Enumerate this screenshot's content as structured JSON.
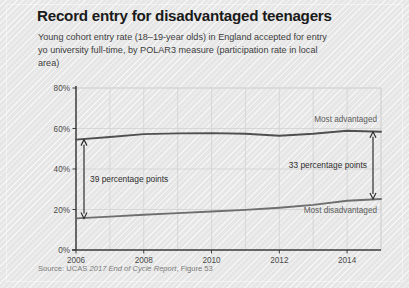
{
  "title": "Record entry for disadvantaged teenagers",
  "subtitle": "Young cohort entry rate (18–19-year olds) in England accepted for entry yo university full-time, by POLAR3 measure (participation rate in local area)",
  "source": {
    "prefix": "Source: UCAS ",
    "report": "2017 End of Cycle Report",
    "suffix": ", Figure 53"
  },
  "colors": {
    "background": "#e9e9e9",
    "title": "#1a1a1a",
    "subtitle": "#3d3d3d",
    "source": "#7b7b7b",
    "line_advantaged": "#4f4f4f",
    "line_disadvantaged": "#6e6e6e",
    "axis": "#3a3a3a",
    "grid": "#d2d2d2",
    "annotation": "#2e2e2e"
  },
  "chart_data": {
    "type": "line",
    "title": "Record entry for disadvantaged teenagers",
    "xlabel": "",
    "ylabel": "",
    "xlim": [
      2006,
      2015
    ],
    "ylim": [
      0,
      80
    ],
    "yticks": [
      0,
      20,
      40,
      60,
      80
    ],
    "ytick_labels": [
      "0%",
      "20%",
      "40%",
      "60%",
      "80%"
    ],
    "xticks": [
      2006,
      2008,
      2010,
      2012,
      2014
    ],
    "xtick_labels": [
      "2006",
      "2008",
      "2010",
      "2012",
      "2014"
    ],
    "grid": true,
    "legend": "inline-labels",
    "x": [
      2006,
      2007,
      2008,
      2009,
      2010,
      2011,
      2012,
      2013,
      2014,
      2015
    ],
    "series": [
      {
        "name": "Most advantaged",
        "label": "Most advantaged",
        "values": [
          54.5,
          55.8,
          57.2,
          57.6,
          57.7,
          57.4,
          56.4,
          57.4,
          58.9,
          58.4
        ]
      },
      {
        "name": "Most disadvantaged",
        "label": "Most disadvantaged",
        "values": [
          15.6,
          16.5,
          17.4,
          18.2,
          19.0,
          19.8,
          20.9,
          22.3,
          24.3,
          25.2
        ]
      }
    ],
    "annotations": [
      {
        "text": "39 percentage points",
        "at_x": 2006,
        "from_value": 15.6,
        "to_value": 54.5,
        "arrow": "double"
      },
      {
        "text": "33 percentage points",
        "at_x": 2015,
        "from_value": 25.2,
        "to_value": 58.4,
        "arrow": "double"
      }
    ]
  }
}
